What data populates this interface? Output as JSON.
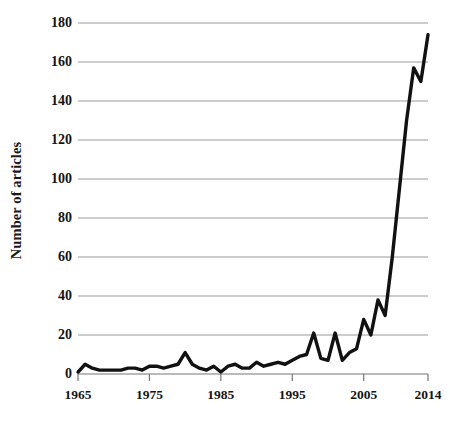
{
  "chart_data": {
    "type": "line",
    "title": "",
    "xlabel": "",
    "ylabel": "Number of articles",
    "ylim": [
      0,
      180
    ],
    "xlim": [
      1965,
      2014
    ],
    "grid": true,
    "legend": "none",
    "y_ticks": [
      0,
      20,
      40,
      60,
      80,
      100,
      120,
      140,
      160,
      180
    ],
    "x_ticks": [
      1965,
      1975,
      1985,
      1995,
      2005,
      2014
    ],
    "x_tick_labels": [
      "1965",
      "1975",
      "1985",
      "1995",
      "2005",
      "2014"
    ],
    "y_tick_labels": [
      "0",
      "20",
      "40",
      "60",
      "80",
      "100",
      "120",
      "140",
      "160",
      "180"
    ],
    "line_color": "#111111",
    "line_width": 3.4,
    "grid_color": "#9a9a9a",
    "background": "#ffffff",
    "x": [
      1965,
      1966,
      1967,
      1968,
      1969,
      1970,
      1971,
      1972,
      1973,
      1974,
      1975,
      1976,
      1977,
      1978,
      1979,
      1980,
      1981,
      1982,
      1983,
      1984,
      1985,
      1986,
      1987,
      1988,
      1989,
      1990,
      1991,
      1992,
      1993,
      1994,
      1995,
      1996,
      1997,
      1998,
      1999,
      2000,
      2001,
      2002,
      2003,
      2004,
      2005,
      2006,
      2007,
      2008,
      2009,
      2010,
      2011,
      2012,
      2013,
      2014
    ],
    "values": [
      1,
      5,
      3,
      2,
      2,
      2,
      2,
      3,
      3,
      2,
      4,
      4,
      3,
      4,
      5,
      11,
      5,
      3,
      2,
      4,
      1,
      4,
      5,
      3,
      3,
      6,
      4,
      5,
      6,
      5,
      7,
      9,
      10,
      21,
      8,
      7,
      21,
      7,
      11,
      13,
      28,
      20,
      38,
      30,
      60,
      95,
      130,
      157,
      150,
      174
    ],
    "series": [
      {
        "name": "Number of articles",
        "values": [
          1,
          5,
          3,
          2,
          2,
          2,
          2,
          3,
          3,
          2,
          4,
          4,
          3,
          4,
          5,
          11,
          5,
          3,
          2,
          4,
          1,
          4,
          5,
          3,
          3,
          6,
          4,
          5,
          6,
          5,
          7,
          9,
          10,
          21,
          8,
          7,
          21,
          7,
          11,
          13,
          28,
          20,
          38,
          30,
          60,
          95,
          130,
          157,
          150,
          174
        ]
      }
    ],
    "annotations": []
  }
}
